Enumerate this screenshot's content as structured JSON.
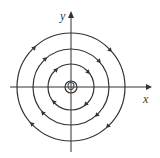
{
  "diagram": {
    "title": "",
    "type": "phase-portrait-center",
    "axes": {
      "x_label": "x",
      "y_label": "y",
      "origin_label": "O"
    },
    "orbits": [
      {
        "name": "orbit-1",
        "radius": 6
      },
      {
        "name": "orbit-2",
        "radius": 23
      },
      {
        "name": "orbit-3",
        "radius": 38
      },
      {
        "name": "orbit-4",
        "radius": 54
      }
    ],
    "direction": "clockwise",
    "colors": {
      "stroke": "#333333",
      "background": "#ffffff"
    }
  }
}
